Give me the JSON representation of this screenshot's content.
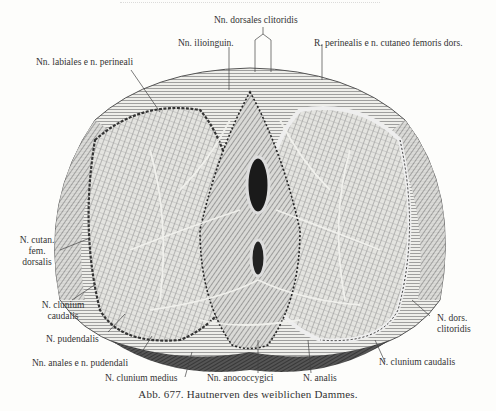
{
  "figure": {
    "number": "Abb. 677.",
    "title": "Hautnerven des weiblichen Dammes.",
    "caption": "Abb. 677.  Hautnerven des weiblichen Dammes."
  },
  "labels": {
    "dorsales_clitoridis": "Nn. dorsales clitoridis",
    "ilioinguin": "Nn. ilioinguin.",
    "r_perinealis": "R. perinealis e n. cutaneo femoris dors.",
    "labiales": "Nn. labiales e n. perineali",
    "cutan_fem_1": "N. cutan.",
    "cutan_fem_2": "fem.",
    "cutan_fem_3": "dorsalis",
    "clunium_caudalis_left_1": "N. clunium",
    "clunium_caudalis_left_2": "caudalis",
    "pudendalis": "N. pudendalis",
    "anales": "Nn. anales e n. pudendali",
    "clunium_medius": "N. clunium medius",
    "anococcygici": "Nn. anococcygici",
    "analis": "N. analis",
    "clunium_caudalis_right": "N. clunium caudalis",
    "dors_clitoridis_right_1": "N. dors.",
    "dors_clitoridis_right_2": "clitoridis"
  },
  "colors": {
    "paper": "#fdfdfb",
    "ink": "#333333",
    "shade_dark": "#2a2a2a",
    "shade_mid": "#7a7a7a",
    "shade_light": "#c8c8c8"
  }
}
